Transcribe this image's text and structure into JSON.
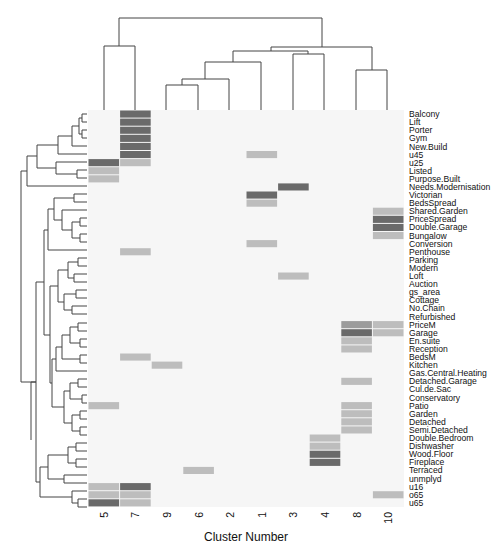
{
  "chart_data": {
    "type": "heatmap",
    "title": "",
    "xlabel": "Cluster Number",
    "ylabel": "",
    "columns": [
      "5",
      "7",
      "9",
      "6",
      "2",
      "1",
      "3",
      "4",
      "8",
      "10"
    ],
    "rows": [
      "Balcony",
      "Lift",
      "Porter",
      "Gym",
      "New.Build",
      "u45",
      "u25",
      "Listed",
      "Purpose.Built",
      "Needs.Modernisation",
      "Victorian",
      "BedsSpread",
      "Shared.Garden",
      "PriceSpread",
      "Double.Garage",
      "Bungalow",
      "Conversion",
      "Penthouse",
      "Parking",
      "Modern",
      "Loft",
      "Auction",
      "gs_area",
      "Cottage",
      "No.Chain",
      "Refurbished",
      "PriceM",
      "Garage",
      "En.suite",
      "Reception",
      "BedsM",
      "Kitchen",
      "Gas.Central.Heating",
      "Detached.Garage",
      "Cul.de.Sac",
      "Conservatory",
      "Patio",
      "Garden",
      "Detached",
      "Semi.Detached",
      "Double.Bedroom",
      "Dishwasher",
      "Wood.Floor",
      "Fireplace",
      "Terraced",
      "unmplyd",
      "u16",
      "o65",
      "u65"
    ],
    "levels_note": "0=background, 1=light, 2=medium, 3=dark",
    "values": [
      [
        0,
        3,
        0,
        0,
        0,
        0,
        0,
        0,
        0,
        0
      ],
      [
        0,
        3,
        0,
        0,
        0,
        0,
        0,
        0,
        0,
        0
      ],
      [
        0,
        3,
        0,
        0,
        0,
        0,
        0,
        0,
        0,
        0
      ],
      [
        0,
        3,
        0,
        0,
        0,
        0,
        0,
        0,
        0,
        0
      ],
      [
        0,
        3,
        0,
        0,
        0,
        0,
        0,
        0,
        0,
        0
      ],
      [
        0,
        3,
        0,
        0,
        0,
        1,
        0,
        0,
        0,
        0
      ],
      [
        3,
        1,
        0,
        0,
        0,
        0,
        0,
        0,
        0,
        0
      ],
      [
        1,
        0,
        0,
        0,
        0,
        0,
        0,
        0,
        0,
        0
      ],
      [
        1,
        0,
        0,
        0,
        0,
        0,
        0,
        0,
        0,
        0
      ],
      [
        0,
        0,
        0,
        0,
        0,
        0,
        3,
        0,
        0,
        0
      ],
      [
        0,
        0,
        0,
        0,
        0,
        3,
        0,
        0,
        0,
        0
      ],
      [
        0,
        0,
        0,
        0,
        0,
        1,
        0,
        0,
        0,
        0
      ],
      [
        0,
        0,
        0,
        0,
        0,
        0,
        0,
        0,
        0,
        1
      ],
      [
        0,
        0,
        0,
        0,
        0,
        0,
        0,
        0,
        0,
        3
      ],
      [
        0,
        0,
        0,
        0,
        0,
        0,
        0,
        0,
        0,
        3
      ],
      [
        0,
        0,
        0,
        0,
        0,
        0,
        0,
        0,
        0,
        1
      ],
      [
        0,
        0,
        0,
        0,
        0,
        1,
        0,
        0,
        0,
        0
      ],
      [
        0,
        1,
        0,
        0,
        0,
        0,
        0,
        0,
        0,
        0
      ],
      [
        0,
        0,
        0,
        0,
        0,
        0,
        0,
        0,
        0,
        0
      ],
      [
        0,
        0,
        0,
        0,
        0,
        0,
        0,
        0,
        0,
        0
      ],
      [
        0,
        0,
        0,
        0,
        0,
        0,
        1,
        0,
        0,
        0
      ],
      [
        0,
        0,
        0,
        0,
        0,
        0,
        0,
        0,
        0,
        0
      ],
      [
        0,
        0,
        0,
        0,
        0,
        0,
        0,
        0,
        0,
        0
      ],
      [
        0,
        0,
        0,
        0,
        0,
        0,
        0,
        0,
        0,
        0
      ],
      [
        0,
        0,
        0,
        0,
        0,
        0,
        0,
        0,
        0,
        0
      ],
      [
        0,
        0,
        0,
        0,
        0,
        0,
        0,
        0,
        0,
        0
      ],
      [
        0,
        0,
        0,
        0,
        0,
        0,
        0,
        0,
        2,
        1
      ],
      [
        0,
        0,
        0,
        0,
        0,
        0,
        0,
        0,
        3,
        1
      ],
      [
        0,
        0,
        0,
        0,
        0,
        0,
        0,
        0,
        1,
        0
      ],
      [
        0,
        0,
        0,
        0,
        0,
        0,
        0,
        0,
        1,
        0
      ],
      [
        0,
        1,
        0,
        0,
        0,
        0,
        0,
        0,
        0,
        0
      ],
      [
        0,
        0,
        1,
        0,
        0,
        0,
        0,
        0,
        0,
        0
      ],
      [
        0,
        0,
        0,
        0,
        0,
        0,
        0,
        0,
        0,
        0
      ],
      [
        0,
        0,
        0,
        0,
        0,
        0,
        0,
        0,
        1,
        0
      ],
      [
        0,
        0,
        0,
        0,
        0,
        0,
        0,
        0,
        0,
        0
      ],
      [
        0,
        0,
        0,
        0,
        0,
        0,
        0,
        0,
        0,
        0
      ],
      [
        1,
        0,
        0,
        0,
        0,
        0,
        0,
        0,
        1,
        0
      ],
      [
        0,
        0,
        0,
        0,
        0,
        0,
        0,
        0,
        1,
        0
      ],
      [
        0,
        0,
        0,
        0,
        0,
        0,
        0,
        0,
        1,
        0
      ],
      [
        0,
        0,
        0,
        0,
        0,
        0,
        0,
        0,
        1,
        0
      ],
      [
        0,
        0,
        0,
        0,
        0,
        0,
        0,
        1,
        0,
        0
      ],
      [
        0,
        0,
        0,
        0,
        0,
        0,
        0,
        1,
        0,
        0
      ],
      [
        0,
        0,
        0,
        0,
        0,
        0,
        0,
        3,
        0,
        0
      ],
      [
        0,
        0,
        0,
        0,
        0,
        0,
        0,
        3,
        0,
        0
      ],
      [
        0,
        0,
        0,
        1,
        0,
        0,
        0,
        0,
        0,
        0
      ],
      [
        0,
        0,
        0,
        0,
        0,
        0,
        0,
        0,
        0,
        0
      ],
      [
        1,
        3,
        0,
        0,
        0,
        0,
        0,
        0,
        0,
        0
      ],
      [
        1,
        1,
        0,
        0,
        0,
        0,
        0,
        0,
        0,
        1
      ],
      [
        3,
        1,
        0,
        0,
        0,
        0,
        0,
        0,
        0,
        0
      ]
    ],
    "colors": {
      "0": "#f6f6f6",
      "1": "#bdbdbd",
      "2": "#9c9c9c",
      "3": "#6a6a6a"
    },
    "grid": false,
    "legend": null,
    "col_dendrogram": "((5,7),(((((9,6),2),1),(3,4)),(8,10)))",
    "row_dendrogram": "hierarchical clustering shown on left"
  }
}
